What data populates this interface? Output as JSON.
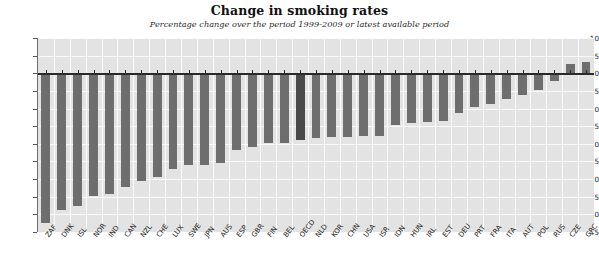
{
  "chart_data": {
    "type": "bar",
    "title": "Change in smoking rates",
    "subtitle": "Percentage change over the period 1999-2009 or latest available period",
    "xlabel": "",
    "ylabel": "",
    "ylim": [
      -45,
      10
    ],
    "ytick_step": 5,
    "grid": true,
    "legend": "none",
    "bar_color": "#6e6e6e",
    "highlight_color": "#4a4a4a",
    "highlight_category": "OECD",
    "plot_background": "#e3e3e3",
    "gridline_color": "#fbfbfb",
    "zero_line_color": "#2a2a2a",
    "ytick_labels": [
      "10",
      "5",
      "0",
      "-5",
      "-10",
      "-15",
      "-20",
      "-25",
      "-30",
      "-35",
      "-40",
      "-45"
    ],
    "ytick_values": [
      10,
      5,
      0,
      -5,
      -10,
      -15,
      -20,
      -25,
      -30,
      -35,
      -40,
      -45
    ],
    "categories": [
      "ZAF",
      "DNK",
      "ISL",
      "NOR",
      "IND",
      "CAN",
      "NZL",
      "CHE",
      "LUX",
      "SWE",
      "JPN",
      "AUS",
      "ESP",
      "GBR",
      "FIN",
      "BEL",
      "OECD",
      "NLD",
      "KOR",
      "CHN",
      "USA",
      "ISR",
      "IDN",
      "HUN",
      "IRL",
      "EST",
      "DEU",
      "PRT",
      "FRA",
      "ITA",
      "AUT",
      "POL",
      "RUS",
      "CZE",
      "GRC"
    ],
    "values": [
      -42.5,
      -38.7,
      -37.5,
      -34.7,
      -34.2,
      -32.2,
      -30.6,
      -29.5,
      -27.2,
      -26.1,
      -26.0,
      -25.3,
      -21.7,
      -21.0,
      -19.8,
      -19.7,
      -18.8,
      -18.4,
      -18.2,
      -18.0,
      -17.9,
      -17.7,
      -14.8,
      -14.2,
      -13.9,
      -13.6,
      -11.3,
      -9.6,
      -8.6,
      -7.3,
      -6.1,
      -4.8,
      -2.1,
      2.5,
      3.2
    ]
  }
}
